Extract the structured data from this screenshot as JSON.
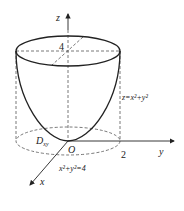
{
  "diagram": {
    "type": "3d-surface-sketch",
    "surface_label": "z=x²+y²",
    "region_label_main": "D",
    "region_label_sub": "xy",
    "boundary_label": "x²+y²=4",
    "origin_label": "O",
    "axes": {
      "x": "x",
      "y": "y",
      "z": "z"
    },
    "ticks": {
      "z_height": "4",
      "y_radius": "2"
    },
    "colors": {
      "stroke": "#222222",
      "dashed": "#555555",
      "background": "#ffffff"
    }
  }
}
